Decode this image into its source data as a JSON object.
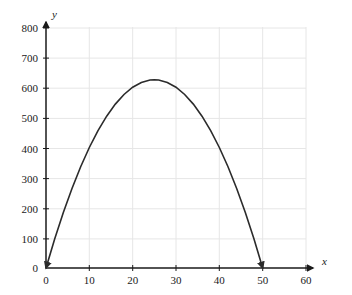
{
  "chart_data": {
    "type": "line",
    "title": "",
    "subtitle": "",
    "xlabel": "x",
    "ylabel": "y",
    "xlim": [
      0,
      60
    ],
    "ylim": [
      0,
      800
    ],
    "xticks": [
      0,
      10,
      20,
      30,
      40,
      50,
      60
    ],
    "yticks": [
      0,
      100,
      200,
      300,
      400,
      500,
      600,
      700,
      800
    ],
    "xtick_labels": [
      "0",
      "10",
      "20",
      "30",
      "40",
      "50",
      "60"
    ],
    "ytick_labels": [
      "0",
      "100",
      "200",
      "300",
      "400",
      "500",
      "600",
      "700",
      "800"
    ],
    "grid": true,
    "legend": false,
    "legend_position": "none",
    "series": [
      {
        "name": "y = x(50 - x)",
        "color": "#2b2b2b",
        "line_width": 1.6,
        "arrow_start": true,
        "arrow_end": true,
        "vertex": [
          25,
          625
        ],
        "x_intercepts": [
          0,
          50
        ],
        "x": [
          0,
          2,
          4,
          6,
          8,
          10,
          12,
          14,
          16,
          18,
          20,
          22,
          24,
          25,
          26,
          28,
          30,
          32,
          34,
          36,
          38,
          40,
          42,
          44,
          46,
          48,
          50
        ],
        "values": [
          0,
          96,
          184,
          264,
          336,
          400,
          456,
          504,
          544,
          576,
          600,
          616,
          624,
          625,
          624,
          616,
          600,
          576,
          544,
          504,
          456,
          400,
          336,
          264,
          184,
          96,
          0
        ]
      }
    ],
    "annotations": [],
    "axis_color": "#1a1a1a",
    "grid_color": "#e4e4e4",
    "background_color": "#ffffff"
  },
  "axes": {
    "x_axis_label": "x",
    "y_axis_label": "y",
    "x_arrow": "arrow-right",
    "y_arrow": "arrow-up"
  }
}
